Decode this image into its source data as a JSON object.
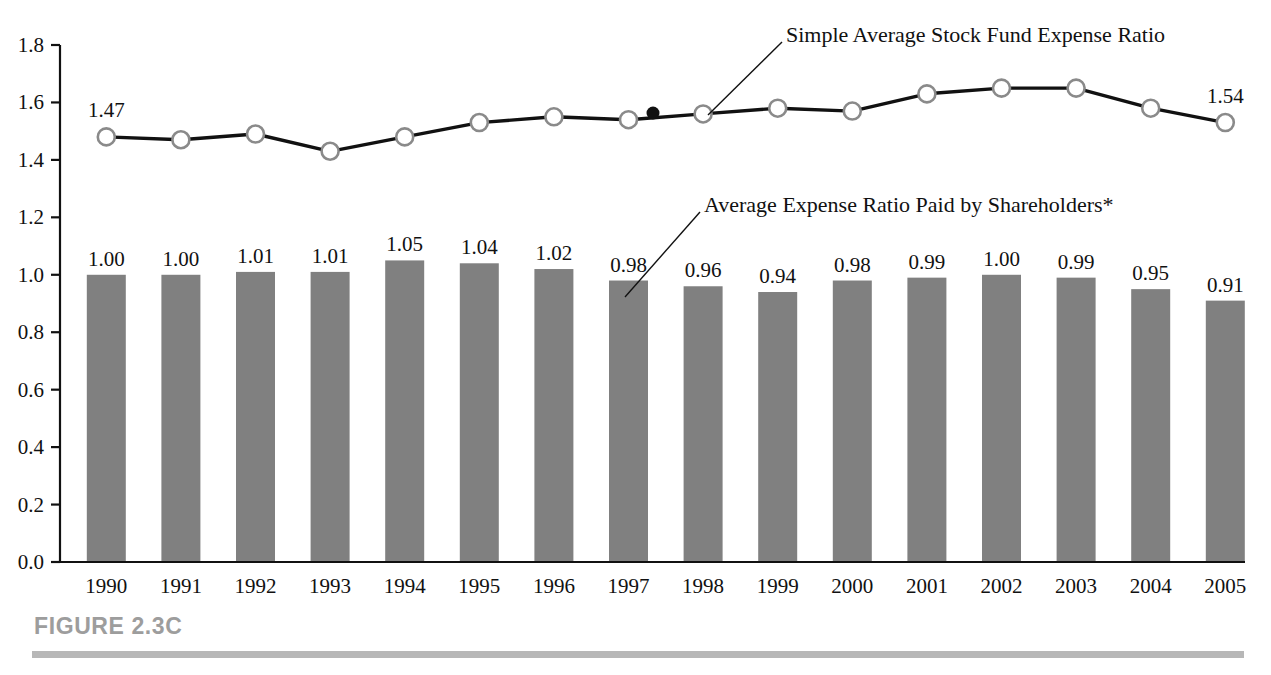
{
  "figure": {
    "caption": "FIGURE 2.3C"
  },
  "annotations": [
    {
      "id": "line-series-callout",
      "text": "Simple Average Stock Fund Expense Ratio"
    },
    {
      "id": "bar-series-callout",
      "text": "Average Expense Ratio Paid by Shareholders*"
    }
  ],
  "colors": {
    "bar_fill": "#808080",
    "line_stroke": "#111111",
    "marker_fill": "#ffffff",
    "marker_stroke": "#8a8a8a",
    "axis": "#111111",
    "caption_gray": "#9d9d9d",
    "rule_gray": "#b7b7b7"
  },
  "chart_data": {
    "type": "bar",
    "title": "",
    "xlabel": "",
    "ylabel": "",
    "ylim": [
      0.0,
      1.8
    ],
    "grid": false,
    "legend_position": "annotations",
    "categories": [
      "1990",
      "1991",
      "1992",
      "1993",
      "1994",
      "1995",
      "1996",
      "1997",
      "1998",
      "1999",
      "2000",
      "2001",
      "2002",
      "2003",
      "2004",
      "2005"
    ],
    "y_ticks": [
      "0.0",
      "0.2",
      "0.4",
      "0.6",
      "0.8",
      "1.0",
      "1.2",
      "1.4",
      "1.6",
      "1.8"
    ],
    "y_tick_values": [
      0.0,
      0.2,
      0.4,
      0.6,
      0.8,
      1.0,
      1.2,
      1.4,
      1.6,
      1.8
    ],
    "series": [
      {
        "name": "Average Expense Ratio Paid by Shareholders*",
        "type": "bar",
        "values": [
          1.0,
          1.0,
          1.01,
          1.01,
          1.05,
          1.04,
          1.02,
          0.98,
          0.96,
          0.94,
          0.98,
          0.99,
          1.0,
          0.99,
          0.95,
          0.91
        ],
        "labels": [
          "1.00",
          "1.00",
          "1.01",
          "1.01",
          "1.05",
          "1.04",
          "1.02",
          "0.98",
          "0.96",
          "0.94",
          "0.98",
          "0.99",
          "1.00",
          "0.99",
          "0.95",
          "0.91"
        ],
        "labels_shown": [
          true,
          true,
          true,
          true,
          true,
          true,
          true,
          true,
          true,
          true,
          true,
          true,
          true,
          true,
          true,
          true
        ]
      },
      {
        "name": "Simple Average Stock Fund Expense Ratio",
        "type": "line",
        "values": [
          1.48,
          1.47,
          1.49,
          1.43,
          1.48,
          1.53,
          1.55,
          1.54,
          1.56,
          1.58,
          1.57,
          1.63,
          1.65,
          1.65,
          1.58,
          1.53
        ],
        "labels": [
          "1.47",
          "",
          "",
          "",
          "",
          "",
          "",
          "",
          "",
          "",
          "",
          "",
          "",
          "",
          "",
          "1.54"
        ],
        "labels_shown": [
          true,
          false,
          false,
          false,
          false,
          false,
          false,
          false,
          false,
          false,
          false,
          false,
          false,
          false,
          false,
          true
        ]
      }
    ]
  }
}
